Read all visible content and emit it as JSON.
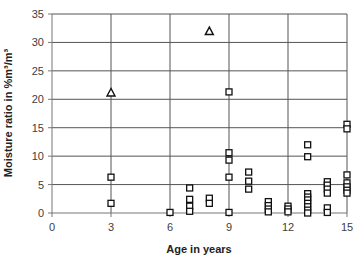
{
  "chart_data": {
    "type": "scatter",
    "title": "",
    "xlabel": "Age in years",
    "ylabel": "Moisture ratio in %m³/m³",
    "xlim": [
      0,
      15
    ],
    "ylim": [
      0,
      35
    ],
    "x_ticks": [
      0,
      3,
      6,
      9,
      12,
      15
    ],
    "y_ticks": [
      0,
      5,
      10,
      15,
      20,
      25,
      30,
      35
    ],
    "grid": true,
    "legend": null,
    "series": [
      {
        "name": "squares",
        "marker": "square",
        "points": [
          [
            3,
            6.3
          ],
          [
            3,
            1.7
          ],
          [
            6,
            0.1
          ],
          [
            7,
            4.4
          ],
          [
            7,
            2.4
          ],
          [
            7,
            1.2
          ],
          [
            7,
            0.3
          ],
          [
            8,
            2.6
          ],
          [
            8,
            1.7
          ],
          [
            9,
            21.3
          ],
          [
            9,
            10.6
          ],
          [
            9,
            9.3
          ],
          [
            9,
            6.3
          ],
          [
            9,
            0.1
          ],
          [
            10,
            7.2
          ],
          [
            10,
            5.6
          ],
          [
            10,
            4.2
          ],
          [
            11,
            2.0
          ],
          [
            11,
            1.3
          ],
          [
            11,
            0.7
          ],
          [
            11,
            0.2
          ],
          [
            12,
            1.2
          ],
          [
            12,
            0.7
          ],
          [
            12,
            0.2
          ],
          [
            13,
            12.0
          ],
          [
            13,
            9.9
          ],
          [
            13,
            3.4
          ],
          [
            13,
            2.8
          ],
          [
            13,
            2.3
          ],
          [
            13,
            1.7
          ],
          [
            13,
            1.1
          ],
          [
            13,
            0.5
          ],
          [
            13,
            0.0
          ],
          [
            14,
            5.5
          ],
          [
            14,
            4.9
          ],
          [
            14,
            4.2
          ],
          [
            14,
            3.5
          ],
          [
            14,
            0.9
          ],
          [
            14,
            0.1
          ],
          [
            15,
            15.6
          ],
          [
            15,
            14.8
          ],
          [
            15,
            6.7
          ],
          [
            15,
            5.3
          ],
          [
            15,
            4.6
          ],
          [
            15,
            4.0
          ],
          [
            15,
            3.5
          ]
        ]
      },
      {
        "name": "triangles",
        "marker": "triangle",
        "points": [
          [
            3,
            21.2
          ],
          [
            8,
            32.0
          ]
        ]
      }
    ]
  }
}
